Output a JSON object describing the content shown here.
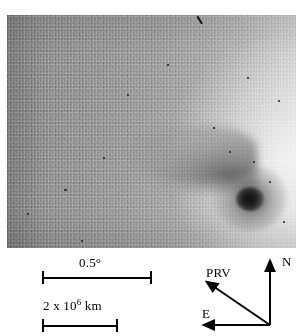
{
  "figure": {
    "image_region": {
      "name": "sky-image",
      "description": "Grayscale negative-style CCD image of a comet with bright coma and nucleus at lower right and a diffuse tail extending toward the upper left",
      "background_tone": "#9a9a9a",
      "nucleus_color": "#111111"
    }
  },
  "scales": {
    "angular": {
      "label": "0.5°",
      "value": "0.5",
      "unit": "degree",
      "bar_length_px": 110
    },
    "linear": {
      "label_prefix": "2 x 10",
      "label_exponent": "6",
      "label_unit": "km",
      "value": "2 x 10^6 km",
      "bar_length_px": 76
    }
  },
  "orientation": {
    "north_label": "N",
    "east_label": "E",
    "prv_label": "PRV",
    "arrow_color": "#000000"
  },
  "colors": {
    "ink": "#000000",
    "paper": "#ffffff",
    "sky_dark": "#8e8e8e",
    "sky_light": "#dcdcdc"
  }
}
